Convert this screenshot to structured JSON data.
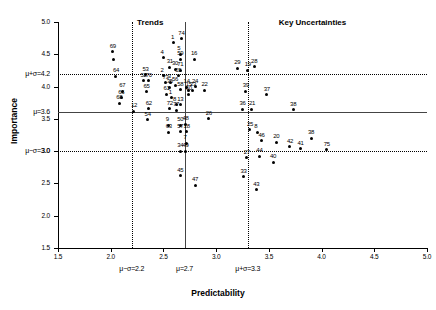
{
  "chart_data": {
    "type": "scatter",
    "title": "",
    "xlabel": "Predictability",
    "ylabel": "Importance",
    "xlim": [
      1.5,
      5.0
    ],
    "ylim": [
      1.5,
      5.0
    ],
    "grid": false,
    "legend": "none",
    "xticks": [
      "1.5",
      "2.0",
      "2.5",
      "3.0",
      "3.5",
      "4.0",
      "4.5",
      "5.0"
    ],
    "yticks": [
      "1.5",
      "2.0",
      "2.5",
      "3.0",
      "3.5",
      "4.0",
      "4.5",
      "5.0"
    ],
    "reference_lines": [
      {
        "axis": "x",
        "value": 2.2,
        "style": "dotted",
        "label": "μ−σ=2.2"
      },
      {
        "axis": "x",
        "value": 2.7,
        "style": "solid",
        "label": "μ=2.7"
      },
      {
        "axis": "x",
        "value": 3.3,
        "style": "dotted",
        "label": "μ+σ=3.3"
      },
      {
        "axis": "y",
        "value": 3.0,
        "style": "dotted",
        "label": "μ−σ=3.0"
      },
      {
        "axis": "y",
        "value": 3.6,
        "style": "solid",
        "label": "μ=3.6"
      },
      {
        "axis": "y",
        "value": 4.2,
        "style": "dotted",
        "label": "μ+σ=4.2"
      }
    ],
    "annotations": [
      {
        "text": "Trends",
        "x": 2.44,
        "y": 4.97
      },
      {
        "text": "Key Uncertainties",
        "x": 4.02,
        "y": 4.97
      }
    ],
    "points": [
      {
        "label": "69",
        "x": 2.02,
        "y": 4.54
      },
      {
        "label": "",
        "x": 2.03,
        "y": 4.42
      },
      {
        "label": "64",
        "x": 2.05,
        "y": 4.16
      },
      {
        "label": "67",
        "x": 2.11,
        "y": 3.93
      },
      {
        "label": "66",
        "x": 2.1,
        "y": 3.83
      },
      {
        "label": "68",
        "x": 2.08,
        "y": 3.74
      },
      {
        "label": "12",
        "x": 2.22,
        "y": 3.62
      },
      {
        "label": "62",
        "x": 2.36,
        "y": 3.66
      },
      {
        "label": "54",
        "x": 2.35,
        "y": 3.49
      },
      {
        "label": "53",
        "x": 2.33,
        "y": 4.18
      },
      {
        "label": "52",
        "x": 2.31,
        "y": 4.09
      },
      {
        "label": "70",
        "x": 2.36,
        "y": 4.09
      },
      {
        "label": "65",
        "x": 2.34,
        "y": 3.92
      },
      {
        "label": "4",
        "x": 2.5,
        "y": 4.45
      },
      {
        "label": "31",
        "x": 2.56,
        "y": 4.3
      },
      {
        "label": "30",
        "x": 2.61,
        "y": 4.27
      },
      {
        "label": "71",
        "x": 2.66,
        "y": 4.25
      },
      {
        "label": "1",
        "x": 2.6,
        "y": 4.68
      },
      {
        "label": "74",
        "x": 2.67,
        "y": 4.74
      },
      {
        "label": "5",
        "x": 2.66,
        "y": 4.5
      },
      {
        "label": "59",
        "x": 2.66,
        "y": 4.42
      },
      {
        "label": "16",
        "x": 2.79,
        "y": 4.42
      },
      {
        "label": "2",
        "x": 2.5,
        "y": 4.17
      },
      {
        "label": "55",
        "x": 2.64,
        "y": 4.17
      },
      {
        "label": "73",
        "x": 2.52,
        "y": 4.06
      },
      {
        "label": "3",
        "x": 2.57,
        "y": 4.07
      },
      {
        "label": "56",
        "x": 2.61,
        "y": 4.02
      },
      {
        "label": "35",
        "x": 2.56,
        "y": 3.99
      },
      {
        "label": "58",
        "x": 2.66,
        "y": 3.95
      },
      {
        "label": "14",
        "x": 2.72,
        "y": 3.99
      },
      {
        "label": "24",
        "x": 2.8,
        "y": 4.0
      },
      {
        "label": "15",
        "x": 2.74,
        "y": 3.94
      },
      {
        "label": "23",
        "x": 2.78,
        "y": 3.94
      },
      {
        "label": "22",
        "x": 2.89,
        "y": 3.94
      },
      {
        "label": "61",
        "x": 2.53,
        "y": 3.88
      },
      {
        "label": "60",
        "x": 2.74,
        "y": 3.88
      },
      {
        "label": "1b",
        "x": 2.58,
        "y": 3.83
      },
      {
        "label": "13",
        "x": 2.66,
        "y": 3.72
      },
      {
        "label": "8b",
        "x": 2.62,
        "y": 3.72
      },
      {
        "label": "72",
        "x": 2.56,
        "y": 3.66
      },
      {
        "label": "77",
        "x": 2.62,
        "y": 3.63
      },
      {
        "label": "9",
        "x": 2.55,
        "y": 3.4
      },
      {
        "label": "63",
        "x": 2.55,
        "y": 3.29
      },
      {
        "label": "50",
        "x": 2.66,
        "y": 3.4
      },
      {
        "label": "48",
        "x": 2.71,
        "y": 3.42
      },
      {
        "label": "57",
        "x": 2.66,
        "y": 3.3
      },
      {
        "label": "18",
        "x": 2.72,
        "y": 3.3
      },
      {
        "label": "7",
        "x": 2.72,
        "y": 3.12
      },
      {
        "label": "34",
        "x": 2.66,
        "y": 3.0
      },
      {
        "label": "49",
        "x": 2.71,
        "y": 3.0
      },
      {
        "label": "45",
        "x": 2.66,
        "y": 2.62
      },
      {
        "label": "47",
        "x": 2.8,
        "y": 2.47
      },
      {
        "label": "26",
        "x": 2.93,
        "y": 3.5
      },
      {
        "label": "29",
        "x": 3.2,
        "y": 4.28
      },
      {
        "label": "19",
        "x": 3.3,
        "y": 4.25
      },
      {
        "label": "28",
        "x": 3.36,
        "y": 4.31
      },
      {
        "label": "39",
        "x": 3.28,
        "y": 3.93
      },
      {
        "label": "37",
        "x": 3.48,
        "y": 3.87
      },
      {
        "label": "36",
        "x": 3.25,
        "y": 3.65
      },
      {
        "label": "21",
        "x": 3.34,
        "y": 3.65
      },
      {
        "label": "38b",
        "x": 3.73,
        "y": 3.64
      },
      {
        "label": "25",
        "x": 3.32,
        "y": 3.33
      },
      {
        "label": "8",
        "x": 3.39,
        "y": 3.29
      },
      {
        "label": "46",
        "x": 3.43,
        "y": 3.16
      },
      {
        "label": "20",
        "x": 3.57,
        "y": 3.14
      },
      {
        "label": "38",
        "x": 3.9,
        "y": 3.2
      },
      {
        "label": "42",
        "x": 3.7,
        "y": 3.07
      },
      {
        "label": "41",
        "x": 3.8,
        "y": 3.04
      },
      {
        "label": "75",
        "x": 4.05,
        "y": 3.02
      },
      {
        "label": "27",
        "x": 3.29,
        "y": 2.9
      },
      {
        "label": "44",
        "x": 3.41,
        "y": 2.92
      },
      {
        "label": "40",
        "x": 3.54,
        "y": 2.83
      },
      {
        "label": "33",
        "x": 3.26,
        "y": 2.6
      },
      {
        "label": "43",
        "x": 3.38,
        "y": 2.4
      }
    ]
  }
}
